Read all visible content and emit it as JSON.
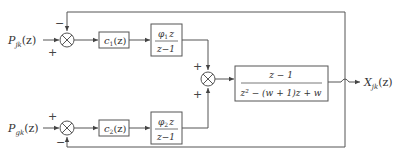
{
  "diagram": {
    "inputs": [
      {
        "id": "input-1",
        "symbol": "P",
        "subscript": "jk",
        "arg": "(z)"
      },
      {
        "id": "input-2",
        "symbol": "P",
        "subscript": "gk",
        "arg": "(z)"
      }
    ],
    "output": {
      "symbol": "X",
      "subscript": "jk",
      "arg": "(z)"
    },
    "summing_junctions": {
      "top": {
        "signs": {
          "left": "+",
          "top": "−"
        }
      },
      "bottom": {
        "signs": {
          "left": "+",
          "bottom": "−"
        }
      },
      "middle": {
        "signs": {
          "top": "+",
          "bottom": "+"
        }
      }
    },
    "blocks": {
      "c1": {
        "label": "c",
        "sub": "1",
        "arg": "(z)"
      },
      "c2": {
        "label": "c",
        "sub": "2",
        "arg": "(z)"
      },
      "phi1": {
        "num": "φ",
        "num_sub": "1",
        "num_var": "z",
        "den": "z−1"
      },
      "phi2": {
        "num": "φ",
        "num_sub": "2",
        "num_var": "z",
        "den": "z−1"
      },
      "plant": {
        "num": "z − 1",
        "den": "z² − (w + 1)z + w"
      }
    }
  }
}
